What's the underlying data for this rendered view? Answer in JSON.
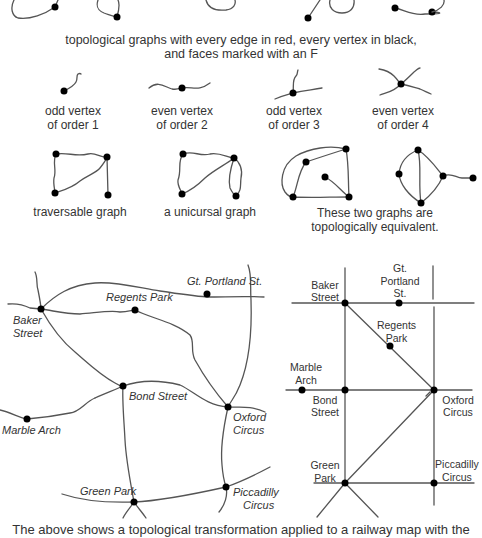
{
  "captions": {
    "top_line1": "topological graphs with every edge in red, every vertex in black,",
    "top_line2": "and faces marked with an F",
    "bottom_partial": "The above shows a topological transformation applied to a railway map with the"
  },
  "vertex_types": [
    {
      "line1": "odd vertex",
      "line2": "of order 1"
    },
    {
      "line1": "even vertex",
      "line2": "of order 2"
    },
    {
      "line1": "odd vertex",
      "line2": "of order 3"
    },
    {
      "line1": "even vertex",
      "line2": "of order 4"
    }
  ],
  "graph_examples": {
    "traversable": "traversable graph",
    "unicursal": "a unicursal graph",
    "equivalent_line1": "These two graphs are",
    "equivalent_line2": "topologically equivalent."
  },
  "left_map": {
    "stations": {
      "baker_street_1": "Baker",
      "baker_street_2": "Street",
      "regents_park": "Regents Park",
      "gt_portland": "Gt. Portland St.",
      "bond_street": "Bond Street",
      "marble_arch": "Marble Arch",
      "oxford_circus_1": "Oxford",
      "oxford_circus_2": "Circus",
      "green_park": "Green Park",
      "piccadilly_1": "Piccadilly",
      "piccadilly_2": "Circus"
    }
  },
  "right_map": {
    "stations": {
      "baker_1": "Baker",
      "baker_2": "Street",
      "gt_1": "Gt.",
      "gt_2": "Portland",
      "gt_3": "St.",
      "regents_1": "Regents",
      "regents_2": "Park",
      "marble_1": "Marble",
      "marble_2": "Arch",
      "bond_1": "Bond",
      "bond_2": "Street",
      "oxford_1": "Oxford",
      "oxford_2": "Circus",
      "green_1": "Green",
      "green_2": "Park",
      "piccadilly_1": "Piccadilly",
      "piccadilly_2": "Circus"
    }
  }
}
